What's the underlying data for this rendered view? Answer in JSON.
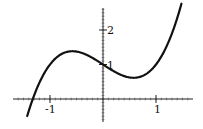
{
  "chart_data": {
    "type": "line",
    "title": "",
    "xlabel": "",
    "ylabel": "",
    "function": "y = x^3 - x + 1",
    "x": [
      -1.43,
      -1.3,
      -1.2,
      -1.1,
      -1.0,
      -0.9,
      -0.8,
      -0.7,
      -0.577,
      -0.5,
      -0.4,
      -0.3,
      -0.2,
      -0.1,
      0.0,
      0.1,
      0.2,
      0.3,
      0.4,
      0.5,
      0.577,
      0.7,
      0.8,
      0.9,
      1.0,
      1.1,
      1.2,
      1.3,
      1.4,
      1.48
    ],
    "series": [
      {
        "name": "curve",
        "values": [
          -0.494,
          0.103,
          0.472,
          0.769,
          1.0,
          1.171,
          1.288,
          1.357,
          1.385,
          1.375,
          1.336,
          1.273,
          1.192,
          1.099,
          1.0,
          0.901,
          0.808,
          0.727,
          0.664,
          0.625,
          0.615,
          0.643,
          0.712,
          0.829,
          1.0,
          1.231,
          1.528,
          1.897,
          2.344,
          2.762
        ],
        "color": "#111111"
      }
    ],
    "x_ticks": [
      -1,
      1
    ],
    "x_tick_labels": [
      "-1",
      "1"
    ],
    "y_ticks": [
      1,
      2
    ],
    "y_tick_labels": [
      "1",
      "2"
    ],
    "xlim": [
      -1.6,
      1.5
    ],
    "ylim": [
      -0.8,
      2.9
    ],
    "grid": false,
    "legend": "none",
    "minor_ticks": true
  }
}
